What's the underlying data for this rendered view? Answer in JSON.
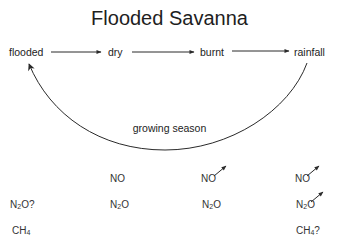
{
  "title": "Flooded Savanna",
  "stages": [
    {
      "label": "flooded"
    },
    {
      "label": "dry"
    },
    {
      "label": "burnt"
    },
    {
      "label": "rainfall"
    }
  ],
  "cycle_label": "growing season",
  "emissions": [
    {
      "stage": "flooded",
      "gases": [
        {
          "html": "N<sub>2</sub>O?",
          "text": "N2O?",
          "increase": false,
          "row": 1
        },
        {
          "html": "CH<sub>4</sub>",
          "text": "CH4",
          "increase": false,
          "row": 2
        }
      ]
    },
    {
      "stage": "dry",
      "gases": [
        {
          "text": "NO",
          "increase": false,
          "row": 0
        },
        {
          "text": "N2O",
          "increase": false,
          "row": 1
        }
      ]
    },
    {
      "stage": "burnt",
      "gases": [
        {
          "text": "NO",
          "increase": true,
          "row": 0
        },
        {
          "text": "N2O",
          "increase": false,
          "row": 1
        }
      ]
    },
    {
      "stage": "rainfall",
      "gases": [
        {
          "text": "NO",
          "increase": true,
          "row": 0
        },
        {
          "text": "N2O",
          "increase": true,
          "row": 1
        },
        {
          "text": "CH4?",
          "increase": false,
          "row": 2
        }
      ]
    }
  ],
  "colors": {
    "line": "#2a2a2a",
    "text": "#222222"
  }
}
